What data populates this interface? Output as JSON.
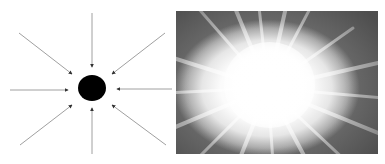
{
  "figure": {
    "left_panel": {
      "description": "Black sphere with eight arrows pointing inward toward it",
      "center": [
        92,
        88
      ],
      "sphere_radius": 14,
      "sphere_color": "#000000",
      "arrow_color": "#9a9a9a",
      "arrowhead_color": "#333333",
      "arrow_count": 8
    },
    "right_panel": {
      "description": "Bright white burst with radiating light rays on a grey background",
      "core_color": "#ffffff",
      "edge_color": "#6d6d6d"
    }
  }
}
